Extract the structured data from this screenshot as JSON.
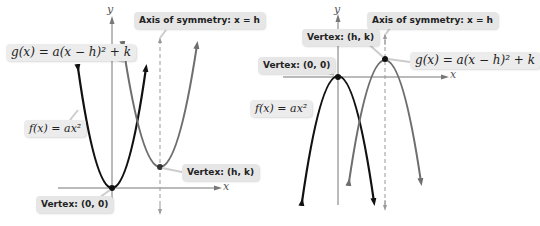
{
  "left_panel": {
    "axis_x_label": "x",
    "axis_y_label": "y",
    "labels": {
      "axis_of_symmetry": "Axis of symmetry: x = h",
      "g_function": "g(x) = a(x − h)² + k",
      "f_function": "f(x) = ax²",
      "vertex_hk": "Vertex: (h, k)",
      "vertex_origin": "Vertex: (0, 0)"
    }
  },
  "right_panel": {
    "axis_x_label": "x",
    "axis_y_label": "y",
    "labels": {
      "axis_of_symmetry": "Axis of symmetry: x = h",
      "vertex_hk": "Vertex: (h, k)",
      "g_function": "g(x) = a(x − h)² + k",
      "vertex_origin": "Vertex: (0, 0)",
      "f_function": "f(x) = ax²"
    }
  },
  "colors": {
    "f_curve": "#111111",
    "g_curve": "#6e6e6e",
    "axis": "#777777",
    "label_bg": "#e6e6e6"
  }
}
